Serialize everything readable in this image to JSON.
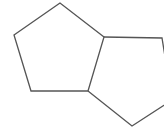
{
  "diagram": {
    "type": "chemical-structure",
    "stroke_color": "#555555",
    "background": "#ffffff",
    "stroke_width": 1.3,
    "vertices": {
      "a": [
        60,
        3
      ],
      "b": [
        14,
        35
      ],
      "c": [
        31,
        91
      ],
      "d": [
        88,
        91
      ],
      "e": [
        104,
        37
      ],
      "f": [
        162,
        38
      ],
      "g": [
        172,
        100
      ],
      "h": [
        132,
        126
      ]
    },
    "rings": [
      {
        "name": "left-ring",
        "path": "M60,3 L14,35 L31,91 L88,91 L104,37 Z"
      },
      {
        "name": "right-ring",
        "path": "M104,37 L162,38 L172,100 L132,126 L88,91"
      }
    ]
  }
}
